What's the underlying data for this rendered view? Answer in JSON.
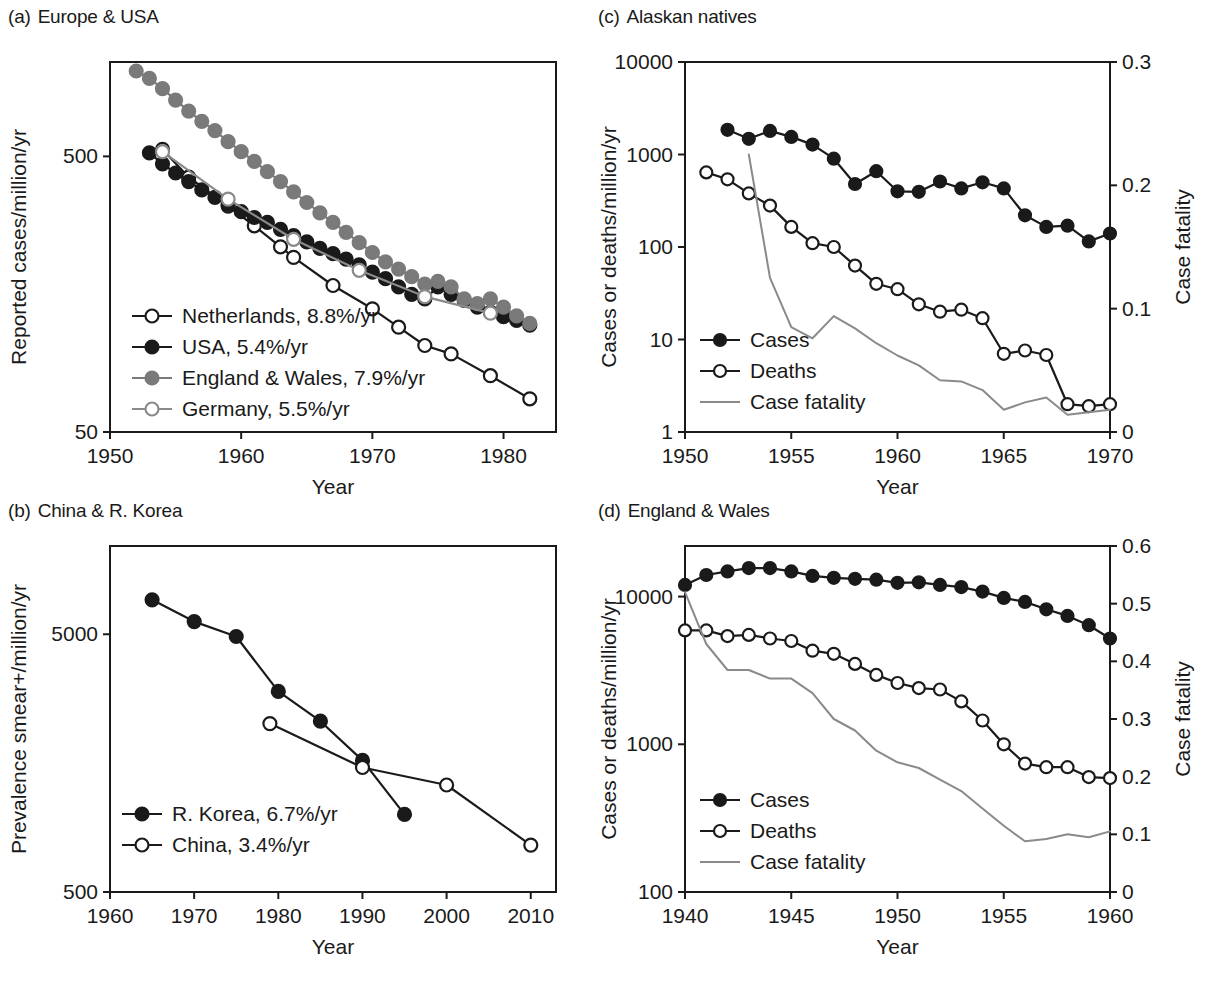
{
  "figure": {
    "panels": [
      {
        "id": "a",
        "tag": "(a)",
        "title": "Europe & USA"
      },
      {
        "id": "b",
        "tag": "(b)",
        "title": "China & R. Korea"
      },
      {
        "id": "c",
        "tag": "(c)",
        "title": "Alaskan natives"
      },
      {
        "id": "d",
        "tag": "(d)",
        "title": "England & Wales"
      }
    ]
  },
  "chart_data": [
    {
      "panel": "a",
      "type": "line",
      "title": "Europe & USA",
      "xlabel": "Year",
      "ylabel": "Reported cases/million/yr",
      "yscale": "log",
      "ylim": [
        50,
        1100
      ],
      "xlim": [
        1950,
        1984
      ],
      "xticks": [
        1950,
        1960,
        1970,
        1980
      ],
      "xticklabels": [
        "1950",
        "1960",
        "1970",
        "1980"
      ],
      "yticks": [
        50,
        500
      ],
      "yticklabels": [
        "50",
        "500"
      ],
      "grid": false,
      "legend_position": "lower-left",
      "series": [
        {
          "name": "Netherlands, 8.8%/yr",
          "marker": "open-circle",
          "color": "#1a1a1a",
          "x": [
            1954,
            1956,
            1959,
            1961,
            1963,
            1964,
            1967,
            1970,
            1972,
            1974,
            1976,
            1979,
            1982
          ],
          "y": [
            530,
            420,
            330,
            280,
            235,
            215,
            170,
            140,
            120,
            103,
            96,
            80,
            66
          ]
        },
        {
          "name": "USA, 5.4%/yr",
          "marker": "filled-circle",
          "color": "#1a1a1a",
          "x": [
            1953,
            1954,
            1955,
            1956,
            1957,
            1958,
            1959,
            1960,
            1961,
            1962,
            1963,
            1964,
            1965,
            1966,
            1967,
            1968,
            1969,
            1970,
            1971,
            1972,
            1973,
            1974,
            1975,
            1976,
            1977,
            1978,
            1979,
            1980,
            1981,
            1982
          ],
          "y": [
            515,
            470,
            435,
            405,
            378,
            355,
            335,
            315,
            300,
            288,
            272,
            258,
            245,
            232,
            222,
            212,
            202,
            190,
            180,
            168,
            158,
            152,
            168,
            158,
            150,
            142,
            136,
            131,
            127,
            122
          ]
        },
        {
          "name": "England & Wales, 7.9%/yr",
          "marker": "filled-circle",
          "color": "#7a7a7a",
          "x": [
            1952,
            1953,
            1954,
            1955,
            1956,
            1957,
            1958,
            1959,
            1960,
            1961,
            1962,
            1963,
            1964,
            1965,
            1966,
            1967,
            1968,
            1969,
            1970,
            1971,
            1972,
            1973,
            1974,
            1975,
            1976,
            1977,
            1978,
            1979,
            1980,
            1981,
            1982
          ],
          "y": [
            1020,
            960,
            880,
            800,
            730,
            670,
            620,
            565,
            520,
            480,
            440,
            405,
            372,
            340,
            312,
            288,
            265,
            243,
            224,
            207,
            195,
            183,
            172,
            176,
            168,
            152,
            146,
            152,
            142,
            132,
            124
          ]
        },
        {
          "name": "Germany, 5.5%/yr",
          "marker": "open-circle",
          "color": "#8a8a8a",
          "x": [
            1954,
            1959,
            1964,
            1969,
            1974,
            1979
          ],
          "y": [
            520,
            350,
            250,
            193,
            155,
            135
          ]
        }
      ]
    },
    {
      "panel": "b",
      "type": "line",
      "title": "China & R. Korea",
      "xlabel": "Year",
      "ylabel": "Prevalence smear+/million/yr",
      "yscale": "log",
      "ylim": [
        500,
        11000
      ],
      "xlim": [
        1960,
        2013
      ],
      "xticks": [
        1960,
        1970,
        1980,
        1990,
        2000,
        2010
      ],
      "xticklabels": [
        "1960",
        "1970",
        "1980",
        "1990",
        "2000",
        "2010"
      ],
      "yticks": [
        500,
        5000
      ],
      "yticklabels": [
        "500",
        "5000"
      ],
      "grid": false,
      "legend_position": "lower-left",
      "series": [
        {
          "name": "R. Korea, 6.7%/yr",
          "marker": "filled-circle",
          "color": "#1a1a1a",
          "x": [
            1965,
            1970,
            1975,
            1980,
            1985,
            1990,
            1995
          ],
          "y": [
            6800,
            5600,
            4900,
            3000,
            2300,
            1620,
            1000
          ]
        },
        {
          "name": "China, 3.4%/yr",
          "marker": "open-circle",
          "color": "#1a1a1a",
          "x": [
            1979,
            1990,
            2000,
            2010
          ],
          "y": [
            2250,
            1520,
            1300,
            760
          ]
        }
      ]
    },
    {
      "panel": "c",
      "type": "line",
      "title": "Alaskan natives",
      "xlabel": "Year",
      "ylabel": "Cases or deaths/million/yr",
      "y2label": "Case fatality",
      "yscale": "log",
      "ylim": [
        1,
        10000
      ],
      "y2lim": [
        0,
        0.3
      ],
      "xlim": [
        1950,
        1970
      ],
      "xticks": [
        1950,
        1955,
        1960,
        1965,
        1970
      ],
      "xticklabels": [
        "1950",
        "1955",
        "1960",
        "1965",
        "1970"
      ],
      "yticks": [
        1,
        10,
        100,
        1000,
        10000
      ],
      "yticklabels": [
        "1",
        "10",
        "100",
        "1000",
        "10000"
      ],
      "y2ticks": [
        0,
        0.1,
        0.2,
        0.3
      ],
      "y2ticklabels": [
        "0",
        "0.1",
        "0.2",
        "0.3"
      ],
      "grid": false,
      "legend_position": "lower-left",
      "series": [
        {
          "name": "Cases",
          "marker": "filled-circle",
          "color": "#1a1a1a",
          "axis": "left",
          "x": [
            1952,
            1953,
            1954,
            1955,
            1956,
            1957,
            1958,
            1959,
            1960,
            1961,
            1962,
            1963,
            1964,
            1965,
            1966,
            1967,
            1968,
            1969,
            1970
          ],
          "y": [
            1850,
            1480,
            1800,
            1550,
            1280,
            900,
            480,
            660,
            400,
            395,
            510,
            430,
            500,
            430,
            220,
            165,
            170,
            115,
            140
          ]
        },
        {
          "name": "Deaths",
          "marker": "open-circle",
          "color": "#1a1a1a",
          "axis": "left",
          "x": [
            1951,
            1952,
            1953,
            1954,
            1955,
            1956,
            1957,
            1958,
            1959,
            1960,
            1961,
            1962,
            1963,
            1964,
            1965,
            1966,
            1967,
            1968,
            1969,
            1970
          ],
          "y": [
            640,
            540,
            380,
            280,
            165,
            110,
            100,
            63,
            40,
            35,
            24,
            20,
            21,
            17,
            7.0,
            7.6,
            6.8,
            2.0,
            1.9,
            2.0
          ]
        },
        {
          "name": "Case fatality",
          "marker": "none",
          "color": "#8a8a8a",
          "axis": "right",
          "x": [
            1953,
            1954,
            1955,
            1956,
            1957,
            1958,
            1959,
            1960,
            1961,
            1962,
            1963,
            1964,
            1965,
            1966,
            1967,
            1968,
            1969,
            1970
          ],
          "y": [
            0.225,
            0.125,
            0.085,
            0.076,
            0.094,
            0.084,
            0.072,
            0.062,
            0.054,
            0.042,
            0.041,
            0.034,
            0.018,
            0.024,
            0.028,
            0.014,
            0.016,
            0.018
          ]
        }
      ]
    },
    {
      "panel": "d",
      "type": "line",
      "title": "England & Wales",
      "xlabel": "Year",
      "ylabel": "Cases or deaths/million/yr",
      "y2label": "Case fatality",
      "yscale": "log",
      "ylim": [
        100,
        22000
      ],
      "y2lim": [
        0,
        0.6
      ],
      "xlim": [
        1940,
        1960
      ],
      "xticks": [
        1940,
        1945,
        1950,
        1955,
        1960
      ],
      "xticklabels": [
        "1940",
        "1945",
        "1950",
        "1955",
        "1960"
      ],
      "yticks": [
        100,
        1000,
        10000
      ],
      "yticklabels": [
        "100",
        "1000",
        "10000"
      ],
      "y2ticks": [
        0,
        0.1,
        0.2,
        0.3,
        0.4,
        0.5,
        0.6
      ],
      "y2ticklabels": [
        "0",
        "0.1",
        "0.2",
        "0.3",
        "0.4",
        "0.5",
        "0.6"
      ],
      "grid": false,
      "legend_position": "lower-left",
      "series": [
        {
          "name": "Cases",
          "marker": "filled-circle",
          "color": "#1a1a1a",
          "axis": "left",
          "x": [
            1940,
            1941,
            1942,
            1943,
            1944,
            1945,
            1946,
            1947,
            1948,
            1949,
            1950,
            1951,
            1952,
            1953,
            1954,
            1955,
            1956,
            1957,
            1958,
            1959,
            1960
          ],
          "y": [
            12000,
            14000,
            14800,
            15600,
            15600,
            14800,
            13800,
            13400,
            13200,
            13000,
            12400,
            12500,
            12000,
            11600,
            10800,
            9800,
            9200,
            8200,
            7400,
            6400,
            5200
          ]
        },
        {
          "name": "Deaths",
          "marker": "open-circle",
          "color": "#1a1a1a",
          "axis": "left",
          "x": [
            1940,
            1941,
            1942,
            1943,
            1944,
            1945,
            1946,
            1947,
            1948,
            1949,
            1950,
            1951,
            1952,
            1953,
            1954,
            1955,
            1956,
            1957,
            1958,
            1959,
            1960
          ],
          "y": [
            5900,
            5900,
            5400,
            5500,
            5200,
            5000,
            4300,
            4100,
            3500,
            2950,
            2600,
            2400,
            2350,
            1950,
            1450,
            1000,
            740,
            700,
            700,
            600,
            590
          ]
        },
        {
          "name": "Case fatality",
          "marker": "none",
          "color": "#8a8a8a",
          "axis": "right",
          "x": [
            1940,
            1941,
            1942,
            1943,
            1944,
            1945,
            1946,
            1947,
            1948,
            1949,
            1950,
            1951,
            1952,
            1953,
            1954,
            1955,
            1956,
            1957,
            1958,
            1959,
            1960
          ],
          "y": [
            0.52,
            0.43,
            0.385,
            0.385,
            0.37,
            0.37,
            0.345,
            0.3,
            0.28,
            0.245,
            0.225,
            0.215,
            0.195,
            0.175,
            0.145,
            0.115,
            0.088,
            0.092,
            0.1,
            0.095,
            0.105
          ]
        }
      ]
    }
  ]
}
